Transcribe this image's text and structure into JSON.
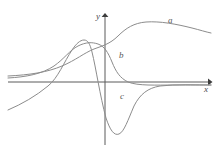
{
  "figure": {
    "kind": "math-plot",
    "background_color": "#ffffff",
    "axis_color": "#5a5a5a",
    "curve_color": "#8c8c8c",
    "label_color": "#4a4a4a"
  },
  "axes": {
    "x_label": "x",
    "y_label": "y",
    "origin_px": {
      "x": 105,
      "y": 82
    },
    "x_axis_from_px": {
      "x": 8,
      "y": 82
    },
    "x_axis_to_px": {
      "x": 211,
      "y": 82
    },
    "y_axis_from_px": {
      "x": 105,
      "y": 145
    },
    "y_axis_to_px": {
      "x": 105,
      "y": 14
    },
    "arrowheads": [
      "x-positive",
      "y-positive"
    ],
    "ticks": [],
    "grid": false
  },
  "curve_labels": [
    {
      "id": "a",
      "text": "a"
    },
    {
      "id": "b",
      "text": "b"
    },
    {
      "id": "c",
      "text": "c"
    }
  ],
  "chart_data": {
    "type": "line",
    "title": "",
    "subtitle": "",
    "xlabel": "x",
    "ylabel": "y",
    "grid": false,
    "legend_position": "inline-annotations",
    "annotations": [
      {
        "text": "a",
        "x_px": 168,
        "y_px": 16
      },
      {
        "text": "b",
        "x_px": 119,
        "y_px": 51
      },
      {
        "text": "c",
        "x_px": 120,
        "y_px": 92
      }
    ],
    "axis_ranges": {
      "xlim_px": [
        8,
        211
      ],
      "ylim_px": [
        145,
        14
      ]
    },
    "series": [
      {
        "name": "a",
        "description": "sigmoid-like curve: asymptotic to x-axis from above on the far left, rises through a shoulder to a broad maximum, then declines slowly toward the right edge",
        "path": "M 8,76 C 30,75 48,72 62,66 C 76,60 84,53 94,49 C 102,46 110,44 118,36 C 126,28 134,23 146,22 C 160,21 176,24 192,28 C 200,30 206,32 211,33",
        "points_px": [
          [
            8,
            76
          ],
          [
            30,
            74
          ],
          [
            48,
            70
          ],
          [
            62,
            66
          ],
          [
            76,
            59
          ],
          [
            88,
            51
          ],
          [
            100,
            48
          ],
          [
            112,
            42
          ],
          [
            124,
            28
          ],
          [
            138,
            22
          ],
          [
            152,
            21
          ],
          [
            168,
            23
          ],
          [
            184,
            26
          ],
          [
            200,
            30
          ],
          [
            211,
            33
          ]
        ]
      },
      {
        "name": "b",
        "description": "bell-like curve peaking left of the y-axis, crossing near the origin and decaying below toward the x-axis asymptotically on the right",
        "path": "M 8,78 C 26,77 42,74 54,66 C 64,59 70,50 78,46 C 86,42 92,42 98,44 C 104,46 108,52 112,62 C 116,72 120,78 128,82 C 138,86 156,85 174,85 C 190,85 202,85 211,85",
        "points_px": [
          [
            8,
            78
          ],
          [
            26,
            76
          ],
          [
            42,
            73
          ],
          [
            54,
            66
          ],
          [
            66,
            56
          ],
          [
            78,
            46
          ],
          [
            90,
            42
          ],
          [
            100,
            45
          ],
          [
            108,
            54
          ],
          [
            116,
            70
          ],
          [
            126,
            80
          ],
          [
            140,
            85
          ],
          [
            158,
            85
          ],
          [
            180,
            85
          ],
          [
            211,
            85
          ]
        ]
      },
      {
        "name": "c",
        "description": "derivative-like curve: rises from below the x-axis on the far left, crosses the axis, peaks just left of the y-axis, plunges steeply to a deep minimum right of the y-axis, then rises back toward the x-axis",
        "path": "M 8,110 C 22,104 36,96 48,86 C 58,78 64,62 72,50 C 76,44 80,40 84,40 C 88,40 90,44 92,52 C 96,68 100,96 106,118 C 110,130 114,136 119,134 C 124,132 128,120 134,106 C 140,94 148,88 160,86 C 176,84 196,85 211,85",
        "points_px": [
          [
            8,
            110
          ],
          [
            24,
            102
          ],
          [
            38,
            94
          ],
          [
            50,
            84
          ],
          [
            62,
            66
          ],
          [
            74,
            48
          ],
          [
            84,
            40
          ],
          [
            92,
            52
          ],
          [
            100,
            86
          ],
          [
            108,
            120
          ],
          [
            116,
            135
          ],
          [
            124,
            130
          ],
          [
            132,
            110
          ],
          [
            142,
            94
          ],
          [
            156,
            87
          ],
          [
            178,
            85
          ],
          [
            211,
            85
          ]
        ]
      }
    ]
  }
}
